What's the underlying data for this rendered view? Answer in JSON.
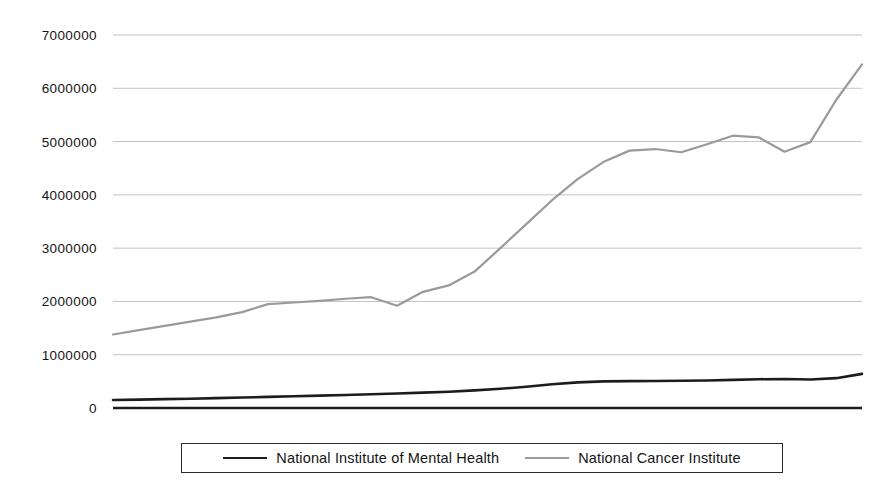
{
  "chart_data": {
    "type": "line",
    "title": "",
    "xlabel": "",
    "ylabel": "",
    "ylim": [
      0,
      7000000
    ],
    "ytick_labels": [
      "7000000",
      "6000000",
      "5000000",
      "4000000",
      "3000000",
      "2000000",
      "1000000",
      "0"
    ],
    "ytick_values": [
      7000000,
      6000000,
      5000000,
      4000000,
      3000000,
      2000000,
      1000000,
      0
    ],
    "grid": true,
    "xaxis_visible": true,
    "xtick_labels": [],
    "legend_position": "bottom",
    "x": [
      0,
      1,
      2,
      3,
      4,
      5,
      6,
      7,
      8,
      9,
      10,
      11,
      12,
      13,
      14,
      15,
      16,
      17,
      18,
      19,
      20,
      21,
      22,
      23,
      24,
      25,
      26,
      27,
      28,
      29
    ],
    "series": [
      {
        "name": "National Institute of Mental Health",
        "color": "#1c1c1c",
        "width": 2.6,
        "values": [
          150000,
          158000,
          166000,
          175000,
          185000,
          196000,
          208000,
          220000,
          232000,
          244000,
          258000,
          272000,
          288000,
          305000,
          330000,
          360000,
          400000,
          445000,
          480000,
          500000,
          505000,
          508000,
          510000,
          515000,
          528000,
          540000,
          545000,
          535000,
          560000,
          640000
        ]
      },
      {
        "name": "National Cancer Institute",
        "color": "#9a9a9a",
        "width": 2.2,
        "values": [
          1380000,
          1460000,
          1540000,
          1620000,
          1700000,
          1800000,
          1950000,
          1980000,
          2010000,
          2050000,
          2080000,
          1920000,
          2180000,
          2300000,
          2560000,
          3000000,
          3450000,
          3900000,
          4300000,
          4620000,
          4830000,
          4860000,
          4800000,
          4950000,
          5110000,
          5080000,
          4810000,
          4990000,
          5780000,
          6450000
        ]
      }
    ],
    "legend": [
      {
        "label": "National Institute of Mental Health",
        "swatch": "nimh"
      },
      {
        "label": "National Cancer Institute",
        "swatch": "nci"
      }
    ]
  }
}
